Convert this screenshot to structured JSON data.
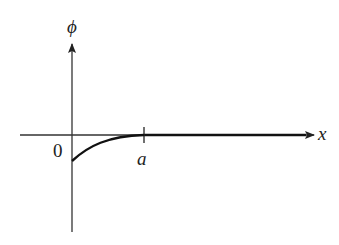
{
  "diagram": {
    "y_axis_label": "ϕ",
    "x_axis_label": "x",
    "origin_label": "0",
    "tick_label": "a",
    "curve": {
      "description": "phi(x) rises from a negative value at x=0 and approaches 0 at x=a, then coincides with x-axis for x>a",
      "start": "negative value at x=0",
      "end": "0 at x=a"
    },
    "colors": {
      "axis": "#333333",
      "curve": "#111111"
    }
  }
}
